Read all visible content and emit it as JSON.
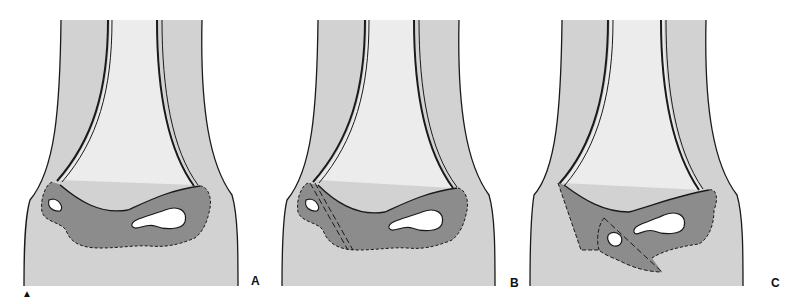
{
  "figure": {
    "colors": {
      "soft_tissue": "#d2d2d2",
      "marrow": "#ececec",
      "physis": "#8c8c8c",
      "outline": "#1a1a1a",
      "background": "#ffffff"
    },
    "panels": [
      {
        "id": "A",
        "label": "A",
        "fracture_line": "none"
      },
      {
        "id": "B",
        "label": "B",
        "fracture_line": "dashed oblique line through physis"
      },
      {
        "id": "C",
        "label": "C",
        "fracture_line": "displaced fragment with dashed outline"
      }
    ],
    "marker": "▲"
  }
}
